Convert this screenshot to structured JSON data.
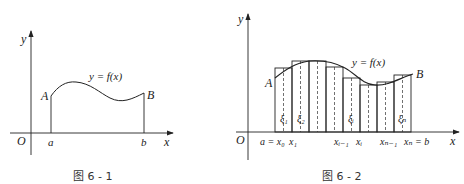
{
  "figure1": {
    "caption": "图 6 - 1",
    "origin_label": "O",
    "x_axis_label": "x",
    "y_axis_label": "y",
    "point_a_label": "A",
    "point_b_label": "B",
    "tick_a_label": "a",
    "tick_b_label": "b",
    "curve_label": "y = f(x)"
  },
  "figure2": {
    "caption": "图 6 - 2",
    "origin_label": "O",
    "x_axis_label": "x",
    "y_axis_label": "y",
    "point_a_label": "A",
    "point_b_label": "B",
    "curve_label": "y = f(x)",
    "tick_labels": [
      "a = x₀",
      "x₁",
      "xᵢ₋₁",
      "xᵢ",
      "xₙ₋₁",
      "xₙ = b"
    ],
    "xi_labels": [
      "ξ₁",
      "ξ₂",
      "ξᵢ",
      "ξₙ"
    ],
    "rectangles": [
      {
        "x0": 275,
        "x1": 292,
        "top": 68
      },
      {
        "x0": 292,
        "x1": 309,
        "top": 61
      },
      {
        "x0": 309,
        "x1": 326,
        "top": 61
      },
      {
        "x0": 326,
        "x1": 343,
        "top": 67
      },
      {
        "x0": 343,
        "x1": 360,
        "top": 78
      },
      {
        "x0": 360,
        "x1": 377,
        "top": 85
      },
      {
        "x0": 377,
        "x1": 394,
        "top": 82
      },
      {
        "x0": 394,
        "x1": 411,
        "top": 75
      }
    ]
  }
}
